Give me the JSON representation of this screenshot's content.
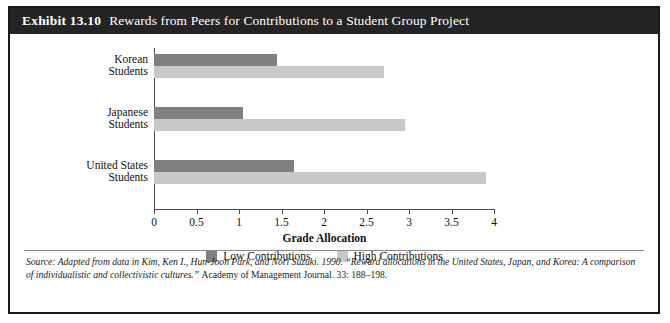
{
  "exhibit": {
    "number": "Exhibit 13.10",
    "title": "Rewards from Peers for Contributions to a Student Group Project"
  },
  "source": {
    "italic_part": "Source: Adapted from data in Kim, Ken I., Hun-Joon Park, and Nori Suzuki. 1990. “Reward allocations in the United States, Japan, and Korea: A comparison of individualistic and collectivistic cultures.” ",
    "plain_part": "Academy of Management Journal. 33: 188–198."
  },
  "colors": {
    "low_contributions": "#808080",
    "high_contributions": "#c8c8c8",
    "title_bar": "#242424",
    "axis": "#4a4a4a",
    "frame": "#1a1a1a"
  },
  "chart_data": {
    "type": "bar",
    "orientation": "horizontal",
    "title": "Rewards from Peers for Contributions to a Student Group Project",
    "xlabel": "Grade Allocation",
    "ylabel": "",
    "xlim": [
      0,
      4
    ],
    "xticks": [
      "0",
      "0.5",
      "1",
      "1.5",
      "2",
      "2.5",
      "3",
      "3.5",
      "4"
    ],
    "xtick_values": [
      0,
      0.5,
      1,
      1.5,
      2,
      2.5,
      3,
      3.5,
      4
    ],
    "grid": false,
    "legend_position": "bottom",
    "categories": [
      "Korean Students",
      "Japanese Students",
      "United States Students"
    ],
    "category_lines": [
      [
        "Korean",
        "Students"
      ],
      [
        "Japanese",
        "Students"
      ],
      [
        "United States",
        "Students"
      ]
    ],
    "series": [
      {
        "name": "Low Contributions",
        "color": "#808080",
        "values": [
          1.45,
          1.05,
          1.65
        ]
      },
      {
        "name": "High Contributions",
        "color": "#c8c8c8",
        "values": [
          2.7,
          2.95,
          3.9
        ]
      }
    ]
  }
}
